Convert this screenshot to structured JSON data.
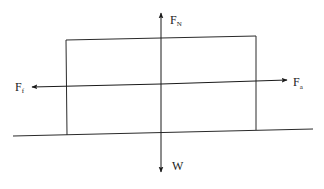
{
  "diagram": {
    "type": "free-body-diagram",
    "colors": {
      "line": "#2a2a2a",
      "background": "#ffffff"
    },
    "forces": {
      "normal": {
        "symbol": "F",
        "subscript": "N",
        "direction": "up"
      },
      "weight": {
        "symbol": "W",
        "subscript": "",
        "direction": "down"
      },
      "friction": {
        "symbol": "F",
        "subscript": "f",
        "direction": "left"
      },
      "applied": {
        "symbol": "F",
        "subscript": "a",
        "direction": "right"
      }
    },
    "objects": {
      "block": "rectangle",
      "ground": "horizontal line"
    }
  }
}
